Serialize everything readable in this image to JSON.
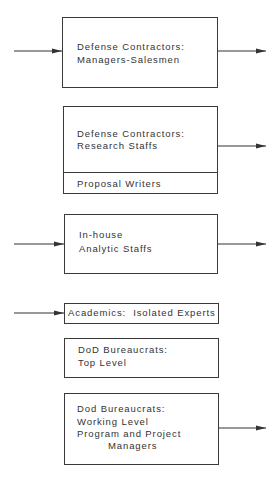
{
  "diagram": {
    "boxes": [
      {
        "id": "managers-salesmen",
        "lines": [
          "Defense Contractors:",
          "Managers-Salesmen"
        ],
        "incoming_arrow": true,
        "outgoing_arrow": true
      },
      {
        "id": "research-staffs",
        "lines": [
          "Defense Contractors:",
          "Research Staffs"
        ],
        "sub_section": "Proposal Writers",
        "incoming_arrow": false,
        "outgoing_arrow": true
      },
      {
        "id": "inhouse-analytic",
        "lines": [
          "In-house",
          "Analytic Staffs"
        ],
        "incoming_arrow": true,
        "outgoing_arrow": true
      },
      {
        "id": "academics",
        "lines": [
          "Academics:  Isolated Experts"
        ],
        "incoming_arrow": true,
        "outgoing_arrow": false
      },
      {
        "id": "dod-top-level",
        "lines": [
          "DoD Bureaucrats:",
          "Top Level"
        ],
        "incoming_arrow": false,
        "outgoing_arrow": false
      },
      {
        "id": "dod-working-level",
        "lines": [
          "Dod Bureaucrats:",
          "Working Level",
          "Program and Project",
          "Managers"
        ],
        "incoming_arrow": false,
        "outgoing_arrow": true
      }
    ],
    "colors": {
      "line": "#3a3a3a",
      "text": "#333333",
      "background": "#ffffff"
    }
  }
}
